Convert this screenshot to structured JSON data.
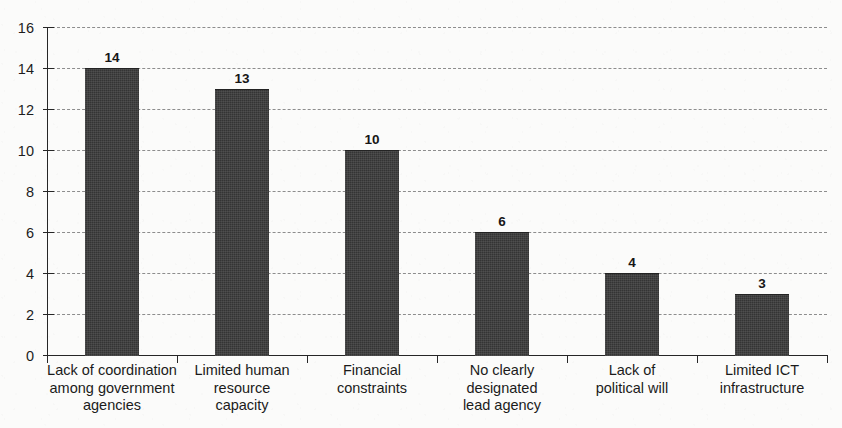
{
  "top_partial_text": "",
  "chart_data": {
    "type": "bar",
    "title": "",
    "subtitle": "",
    "xlabel": "",
    "ylabel": "",
    "categories": [
      "Lack of coordination among government agencies",
      "Limited human resource capacity",
      "Financial constraints",
      "No clearly designated lead agency",
      "Lack of political will",
      "Limited ICT infrastructure"
    ],
    "category_lines": [
      [
        "Lack of coordination",
        "among government",
        "agencies"
      ],
      [
        "Limited human",
        "resource",
        "capacity"
      ],
      [
        "Financial",
        "constraints"
      ],
      [
        "No clearly",
        "designated",
        "lead agency"
      ],
      [
        "Lack of",
        "political will"
      ],
      [
        "Limited ICT",
        "infrastructure"
      ]
    ],
    "values": [
      14,
      13,
      10,
      6,
      4,
      3
    ],
    "value_labels": [
      "14",
      "13",
      "10",
      "6",
      "4",
      "3"
    ],
    "ylim": [
      0,
      16
    ],
    "ytick_values": [
      0,
      2,
      4,
      6,
      8,
      10,
      12,
      14,
      16
    ],
    "ytick_labels": [
      "0",
      "2",
      "4",
      "6",
      "8",
      "10",
      "12",
      "14",
      "16"
    ],
    "grid": true,
    "grid_style": "dashed-horizontal",
    "legend": false,
    "bar_color": "#3a3a3a",
    "grid_color": "#8d8d8d",
    "axis_color": "#262626",
    "background_color": "#fbfbfa"
  }
}
